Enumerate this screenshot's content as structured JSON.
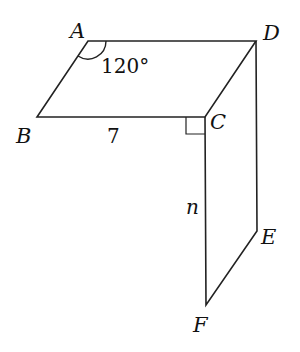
{
  "diagram": {
    "type": "geometry-figure",
    "stroke_color": "#222222",
    "background": "#ffffff"
  },
  "vertices": {
    "A": {
      "label": "A",
      "x": 88,
      "y": 41
    },
    "B": {
      "label": "B",
      "x": 37,
      "y": 117
    },
    "C": {
      "label": "C",
      "x": 205,
      "y": 117
    },
    "D": {
      "label": "D",
      "x": 256,
      "y": 41
    },
    "E": {
      "label": "E",
      "x": 257,
      "y": 231
    },
    "F": {
      "label": "F",
      "x": 206,
      "y": 305
    }
  },
  "annotations": {
    "angle_A": "120°",
    "side_BC": "7",
    "side_CF": "n",
    "right_angle_at": "C"
  }
}
